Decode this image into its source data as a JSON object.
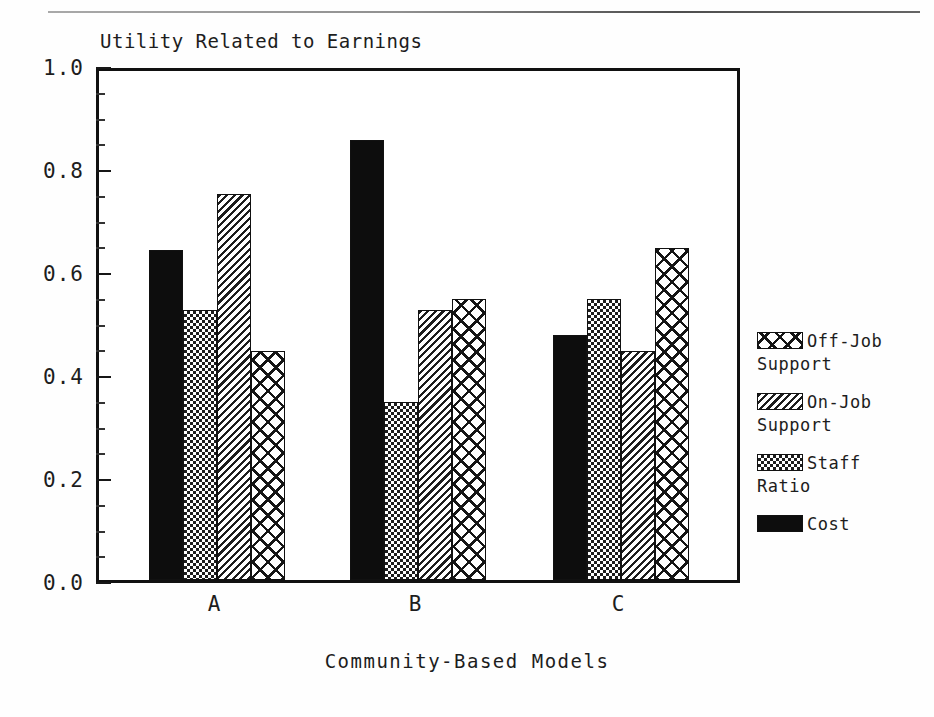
{
  "chart_data": {
    "type": "bar",
    "title": "Utility Related to Earnings",
    "xlabel": "Community-Based Models",
    "ylabel": "",
    "categories": [
      "A",
      "B",
      "C"
    ],
    "ylim": [
      0.0,
      1.0
    ],
    "ytick_labels": [
      "0.0",
      "0.2",
      "0.4",
      "0.6",
      "0.8",
      "1.0"
    ],
    "ytick_values": [
      0.0,
      0.2,
      0.4,
      0.6,
      0.8,
      1.0
    ],
    "minor_tick_step": 0.05,
    "grid": false,
    "legend_position": "right",
    "bar_order": [
      "Cost",
      "Staff Ratio",
      "On-Job Support",
      "Off-Job Support"
    ],
    "series": [
      {
        "name": "Cost",
        "pattern": "solid-black",
        "values": [
          0.64,
          0.855,
          0.475
        ]
      },
      {
        "name": "Staff Ratio",
        "pattern": "fine-checker",
        "values": [
          0.525,
          0.345,
          0.545
        ]
      },
      {
        "name": "On-Job Support",
        "pattern": "diagonal-hatch",
        "values": [
          0.75,
          0.525,
          0.445
        ]
      },
      {
        "name": "Off-Job Support",
        "pattern": "coarse-crosshatch",
        "values": [
          0.445,
          0.545,
          0.645
        ]
      }
    ]
  },
  "legend": {
    "entries": [
      {
        "label": "Off-Job\nSupport",
        "pattern": "coarse-crosshatch"
      },
      {
        "label": "On-Job\nSupport",
        "pattern": "diagonal-hatch"
      },
      {
        "label": "Staff\nRatio",
        "pattern": "fine-checker"
      },
      {
        "label": "Cost",
        "pattern": "solid-black"
      }
    ]
  },
  "colors": {
    "ink": "#111111",
    "background": "#ffffff"
  }
}
